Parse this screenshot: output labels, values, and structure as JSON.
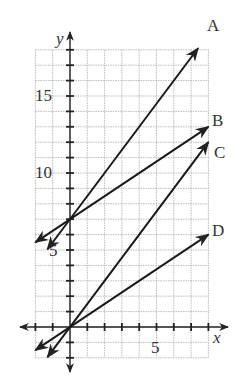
{
  "chart_data": {
    "type": "line",
    "title": "",
    "xlabel": "x",
    "ylabel": "y",
    "xlim": [
      -2,
      8
    ],
    "ylim": [
      -2,
      18
    ],
    "grid": true,
    "x_tick_labels": [
      {
        "value": 5,
        "label": "5"
      }
    ],
    "y_tick_labels": [
      {
        "value": 5,
        "label": "5"
      },
      {
        "value": 10,
        "label": "10"
      },
      {
        "value": 15,
        "label": "15"
      }
    ],
    "series": [
      {
        "name": "A",
        "slope": 1.5,
        "intercept": 7,
        "x": [
          -1.3,
          7.4
        ],
        "y": [
          5.05,
          18.1
        ]
      },
      {
        "name": "B",
        "slope": 0.75,
        "intercept": 7,
        "x": [
          -2,
          8
        ],
        "y": [
          5.5,
          13
        ]
      },
      {
        "name": "C",
        "slope": 1.5,
        "intercept": 0,
        "x": [
          -1.3,
          8
        ],
        "y": [
          -1.95,
          12
        ]
      },
      {
        "name": "D",
        "slope": 0.75,
        "intercept": 0,
        "x": [
          -2,
          8
        ],
        "y": [
          -1.5,
          6
        ]
      }
    ]
  },
  "labels": {
    "x_axis": "x",
    "y_axis": "y",
    "tick_5x": "5",
    "tick_5y": "5",
    "tick_10y": "10",
    "tick_15y": "15",
    "line_a": "A",
    "line_b": "B",
    "line_c": "C",
    "line_d": "D"
  }
}
